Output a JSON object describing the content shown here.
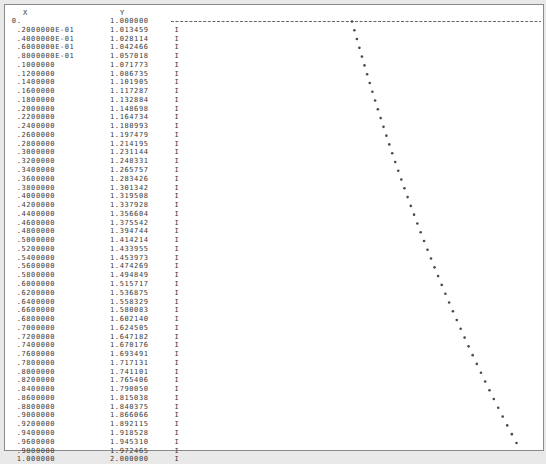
{
  "header": {
    "x_label": "X",
    "y_label": "Y"
  },
  "axis_marker": "I",
  "chart_data": {
    "type": "scatter",
    "title": "",
    "xlabel": "X",
    "ylabel": "Y",
    "orientation": "line-printer: X increases downward, Y plotted horizontally",
    "ylim": [
      1.0,
      2.0
    ],
    "grid": false,
    "x_labels": [
      "0.",
      ".2000000E-01",
      ".4000000E-01",
      ".6000000E-01",
      ".8000000E-01",
      ".1000000",
      ".1200000",
      ".1400000",
      ".1600000",
      ".1800000",
      ".2000000",
      ".2200000",
      ".2400000",
      ".2600000",
      ".2800000",
      ".3000000",
      ".3200000",
      ".3400000",
      ".3600000",
      ".3800000",
      ".4000000",
      ".4200000",
      ".4400000",
      ".4600000",
      ".4800000",
      ".5000000",
      ".5200000",
      ".5400000",
      ".5600000",
      ".5800000",
      ".6000000",
      ".6200000",
      ".6400000",
      ".6600000",
      ".6800000",
      ".7000000",
      ".7200000",
      ".7400000",
      ".7600000",
      ".7800000",
      ".8000000",
      ".8200000",
      ".8400000",
      ".8600000",
      ".8800000",
      ".9000000",
      ".9200000",
      ".9400000",
      ".9600000",
      ".9800000",
      "1.000000"
    ],
    "y_labels": [
      "1.000000",
      "1.013459",
      "1.028114",
      "1.042466",
      "1.057018",
      "1.071773",
      "1.086735",
      "1.101905",
      "1.117287",
      "1.132884",
      "1.148698",
      "1.164734",
      "1.180993",
      "1.197479",
      "1.214195",
      "1.231144",
      "1.248331",
      "1.265757",
      "1.283426",
      "1.301342",
      "1.319508",
      "1.337928",
      "1.356604",
      "1.375542",
      "1.394744",
      "1.414214",
      "1.433955",
      "1.453973",
      "1.474269",
      "1.494849",
      "1.515717",
      "1.536875",
      "1.558329",
      "1.580083",
      "1.602140",
      "1.624505",
      "1.647182",
      "1.670176",
      "1.693491",
      "1.717131",
      "1.741101",
      "1.765406",
      "1.790050",
      "1.815038",
      "1.840375",
      "1.866066",
      "1.892115",
      "1.918528",
      "1.945310",
      "1.972465",
      "2.000000"
    ],
    "x": [
      0,
      0.02,
      0.04,
      0.06,
      0.08,
      0.1,
      0.12,
      0.14,
      0.16,
      0.18,
      0.2,
      0.22,
      0.24,
      0.26,
      0.28,
      0.3,
      0.32,
      0.34,
      0.36,
      0.38,
      0.4,
      0.42,
      0.44,
      0.46,
      0.48,
      0.5,
      0.52,
      0.54,
      0.56,
      0.58,
      0.6,
      0.62,
      0.64,
      0.66,
      0.68,
      0.7,
      0.72,
      0.74,
      0.76,
      0.78,
      0.8,
      0.82,
      0.84,
      0.86,
      0.88,
      0.9,
      0.92,
      0.94,
      0.96,
      0.98,
      1.0
    ],
    "values": [
      1.0,
      1.013459,
      1.028114,
      1.042466,
      1.057018,
      1.071773,
      1.086735,
      1.101905,
      1.117287,
      1.132884,
      1.148698,
      1.164734,
      1.180993,
      1.197479,
      1.214195,
      1.231144,
      1.248331,
      1.265757,
      1.283426,
      1.301342,
      1.319508,
      1.337928,
      1.356604,
      1.375542,
      1.394744,
      1.414214,
      1.433955,
      1.453973,
      1.474269,
      1.494849,
      1.515717,
      1.536875,
      1.558329,
      1.580083,
      1.60214,
      1.624505,
      1.647182,
      1.670176,
      1.693491,
      1.717131,
      1.741101,
      1.765406,
      1.79005,
      1.815038,
      1.840375,
      1.866066,
      1.892115,
      1.918528,
      1.94531,
      1.972465,
      2.0
    ]
  }
}
